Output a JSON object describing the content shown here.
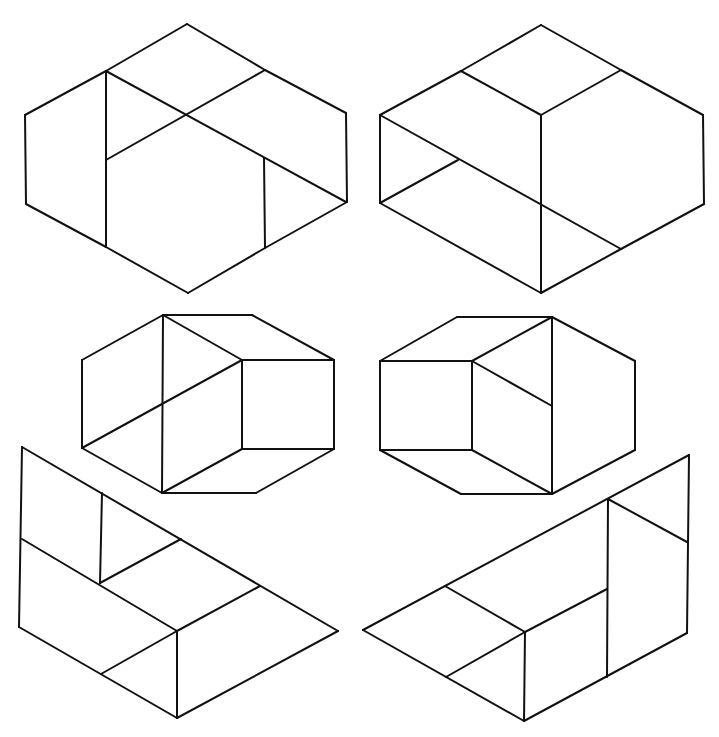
{
  "diagram": {
    "background": "#ffffff",
    "stroke": "#111111",
    "figures": [
      {
        "id": "top-left-hexagon",
        "segments": [
          [
            25,
            115,
            106,
            71
          ],
          [
            106,
            71,
            187,
            24
          ],
          [
            187,
            24,
            265,
            70
          ],
          [
            265,
            70,
            346,
            113
          ],
          [
            346,
            113,
            347,
            202
          ],
          [
            347,
            202,
            265,
            248
          ],
          [
            265,
            248,
            188,
            293
          ],
          [
            188,
            293,
            106,
            247
          ],
          [
            106,
            247,
            26,
            204
          ],
          [
            26,
            204,
            25,
            115
          ],
          [
            106,
            71,
            106,
            247
          ],
          [
            106,
            71,
            346,
            202
          ],
          [
            265,
            70,
            106,
            160
          ],
          [
            264,
            158,
            265,
            248
          ]
        ]
      },
      {
        "id": "top-right-hexagon",
        "segments": [
          [
            380,
            115,
            461,
            71
          ],
          [
            461,
            71,
            541,
            25
          ],
          [
            541,
            25,
            621,
            70
          ],
          [
            621,
            70,
            703,
            115
          ],
          [
            703,
            115,
            704,
            204
          ],
          [
            704,
            204,
            621,
            249
          ],
          [
            621,
            249,
            541,
            293
          ],
          [
            541,
            293,
            380,
            203
          ],
          [
            380,
            203,
            380,
            115
          ],
          [
            461,
            71,
            541,
            115
          ],
          [
            621,
            70,
            541,
            115
          ],
          [
            541,
            115,
            541,
            293
          ],
          [
            380,
            115,
            621,
            249
          ],
          [
            458,
            160,
            380,
            203
          ]
        ]
      },
      {
        "id": "middle-left-octagon",
        "segments": [
          [
            163,
            315,
            252,
            315
          ],
          [
            252,
            315,
            334,
            360
          ],
          [
            334,
            360,
            334,
            449
          ],
          [
            334,
            449,
            256,
            493
          ],
          [
            256,
            493,
            162,
            493
          ],
          [
            162,
            493,
            82,
            448
          ],
          [
            82,
            448,
            82,
            360
          ],
          [
            82,
            360,
            163,
            315
          ],
          [
            163,
            315,
            162,
            493
          ],
          [
            163,
            315,
            242,
            360
          ],
          [
            242,
            360,
            334,
            360
          ],
          [
            242,
            360,
            82,
            448
          ],
          [
            242,
            360,
            242,
            449
          ],
          [
            242,
            449,
            334,
            449
          ],
          [
            242,
            449,
            162,
            493
          ]
        ]
      },
      {
        "id": "middle-right-octagon",
        "segments": [
          [
            457,
            317,
            552,
            317
          ],
          [
            552,
            317,
            635,
            361
          ],
          [
            635,
            361,
            635,
            450
          ],
          [
            635,
            450,
            552,
            494
          ],
          [
            552,
            494,
            461,
            494
          ],
          [
            461,
            494,
            380,
            450
          ],
          [
            380,
            450,
            380,
            361
          ],
          [
            380,
            361,
            457,
            317
          ],
          [
            380,
            361,
            472,
            361
          ],
          [
            472,
            361,
            472,
            450
          ],
          [
            380,
            450,
            472,
            450
          ],
          [
            472,
            361,
            552,
            317
          ],
          [
            552,
            317,
            552,
            494
          ],
          [
            472,
            361,
            552,
            406
          ],
          [
            472,
            450,
            552,
            494
          ]
        ]
      },
      {
        "id": "bottom-left-trapezoid",
        "segments": [
          [
            22,
            447,
            338,
            631
          ],
          [
            338,
            631,
            177,
            718
          ],
          [
            177,
            718,
            19,
            627
          ],
          [
            19,
            627,
            22,
            447
          ],
          [
            22,
            539,
            177,
            631
          ],
          [
            177,
            631,
            177,
            718
          ],
          [
            102,
            493,
            100,
            583
          ],
          [
            100,
            583,
            181,
            539
          ],
          [
            177,
            631,
            260,
            586
          ],
          [
            177,
            631,
            101,
            674
          ]
        ]
      },
      {
        "id": "bottom-right-trapezoid",
        "segments": [
          [
            363,
            630,
            689,
            455
          ],
          [
            689,
            455,
            687,
            633
          ],
          [
            687,
            633,
            524,
            721
          ],
          [
            524,
            721,
            363,
            630
          ],
          [
            608,
            499,
            607,
            677
          ],
          [
            608,
            499,
            687,
            542
          ],
          [
            445,
            586,
            525,
            632
          ],
          [
            525,
            632,
            524,
            721
          ],
          [
            525,
            632,
            607,
            589
          ],
          [
            525,
            632,
            446,
            677
          ]
        ]
      }
    ]
  }
}
